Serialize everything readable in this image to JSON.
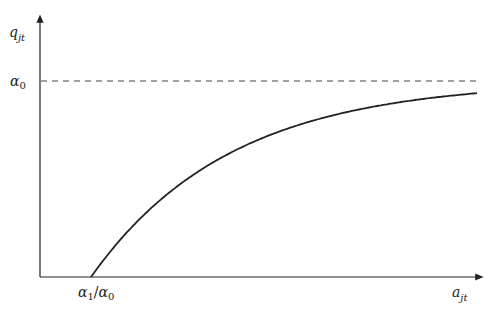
{
  "chart_data": {
    "type": "line",
    "title": "",
    "xlabel": "a_jt",
    "ylabel": "q_jt",
    "x_tick_labels": [
      "α1/α0"
    ],
    "y_tick_labels": [
      "α0"
    ],
    "series": [
      {
        "name": "q_jt curve",
        "description": "concave increasing curve starting at a_jt = α1/α0 (q=0), approaching asymptote α0"
      }
    ],
    "annotations": [
      {
        "type": "horizontal-dashed-line",
        "label": "α0",
        "meaning": "asymptote"
      }
    ],
    "grid": false,
    "legend": null
  },
  "labels": {
    "y_axis": {
      "base": "q",
      "sub": "jt"
    },
    "x_axis": {
      "base": "a",
      "sub": "jt"
    },
    "asymptote": {
      "base": "α",
      "sub": "0"
    },
    "x_intercept": {
      "num_base": "α",
      "num_sub": "1",
      "slash": "/",
      "den_base": "α",
      "den_sub": "0"
    }
  },
  "colors": {
    "axis": "#222222",
    "curve": "#222222",
    "dash": "#444444"
  }
}
